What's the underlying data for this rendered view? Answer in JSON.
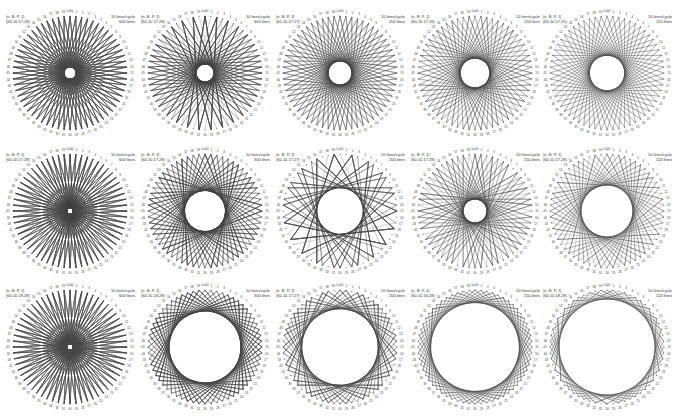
{
  "figure": {
    "points_per_circle": 60,
    "top_label": "0=60",
    "line_color": "#444444",
    "point_color": "#555555"
  },
  "panels": [
    {
      "params_header": "(n, B, P, J)",
      "params": "(60,10,17,28)",
      "rate": "10 lines/cycle",
      "lines": "600 lines",
      "step": 28,
      "count": 600
    },
    {
      "params_header": "(n, B, P, J)",
      "params": "(60,10,17,28)",
      "rate": "10 lines/cycle",
      "lines": "600 lines",
      "step": 27,
      "count": 300
    },
    {
      "params_header": "(n, B, P, J)",
      "params": "(60,10,17,27)",
      "rate": "10 lines/cycle",
      "lines": "200 lines",
      "step": 26,
      "count": 200
    },
    {
      "params_header": "(n, B, P, J)",
      "params": "(60,10,17,26)",
      "rate": "10 lines/cycle",
      "lines": "150 lines",
      "step": 25,
      "count": 150
    },
    {
      "params_header": "(n, B, P, J)",
      "params": "(60,10,17,25)",
      "rate": "10 lines/cycle",
      "lines": "120 lines",
      "step": 24,
      "count": 120
    },
    {
      "params_header": "(n, B, P, J)",
      "params": "(60,10,17,28)",
      "rate": "10 lines/cycle",
      "lines": "600 lines",
      "step": 29,
      "count": 600
    },
    {
      "params_header": "(n, B, P, J)",
      "params": "(60,10,17,28)",
      "rate": "10 lines/cycle",
      "lines": "300 lines",
      "step": 23,
      "count": 300
    },
    {
      "params_header": "(n, B, P, J)",
      "params": "(60,10,17,27)",
      "rate": "10 lines/cycle",
      "lines": "200 lines",
      "step": 22,
      "count": 200
    },
    {
      "params_header": "(n, B, P, J)",
      "params": "(60,10,17,28)",
      "rate": "10 lines/cycle",
      "lines": "150 lines",
      "step": 26,
      "count": 150
    },
    {
      "params_header": "(n, B, P, J)",
      "params": "(60,10,17,28)",
      "rate": "10 lines/cycle",
      "lines": "120 lines",
      "step": 21,
      "count": 120
    },
    {
      "params_header": "(n, B, P, J)",
      "params": "(60,10,18,28)",
      "rate": "10 lines/cycle",
      "lines": "600 lines",
      "step": 29,
      "count": 600
    },
    {
      "params_header": "(n, B, P, J)",
      "params": "(60,10,18,28)",
      "rate": "10 lines/cycle",
      "lines": "300 lines",
      "step": 17,
      "count": 300
    },
    {
      "params_header": "(n, B, P, J)",
      "params": "(60,10,17,27)",
      "rate": "10 lines/cycle",
      "lines": "200 lines",
      "step": 16,
      "count": 200
    },
    {
      "params_header": "(n, B, P, J)",
      "params": "(60,10,16,28)",
      "rate": "10 lines/cycle",
      "lines": "150 lines",
      "step": 13,
      "count": 150
    },
    {
      "params_header": "(n, B, P, J)",
      "params": "(60,10,18,28)",
      "rate": "10 lines/cycle",
      "lines": "120 lines",
      "step": 11,
      "count": 120
    }
  ]
}
